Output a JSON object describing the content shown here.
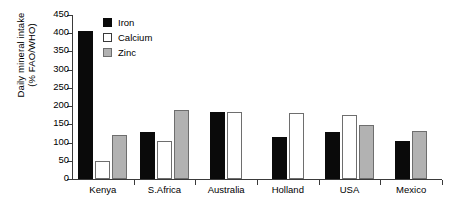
{
  "chart_data": {
    "type": "bar",
    "title": "",
    "xlabel": "",
    "ylabel": "Daily mineral intake (% FAO/WHO)",
    "ylabel_line1": "Daily mineral intake",
    "ylabel_line2": "(% FAO/WHO)",
    "categories": [
      "Kenya",
      "S.Africa",
      "Australia",
      "Holland",
      "USA",
      "Mexico"
    ],
    "series": [
      {
        "name": "Iron",
        "color": "#0a0a0a",
        "values": [
          405,
          130,
          185,
          115,
          130,
          103
        ]
      },
      {
        "name": "Calcium",
        "color": "#ffffff",
        "values": [
          50,
          105,
          185,
          180,
          175,
          null
        ]
      },
      {
        "name": "Zinc",
        "color": "#b2b2b2",
        "values": [
          120,
          190,
          null,
          null,
          147,
          133
        ]
      }
    ],
    "ylim": [
      0,
      450
    ],
    "yticks": [
      0,
      50,
      100,
      150,
      200,
      250,
      300,
      350,
      400,
      450
    ],
    "ytick_labels": [
      "0",
      "50",
      "100",
      "150",
      "200",
      "250",
      "300",
      "350",
      "400",
      "450"
    ],
    "grid": false,
    "legend_position": "top-left-inside",
    "legend": [
      "Iron",
      "Calcium",
      "Zinc"
    ]
  }
}
